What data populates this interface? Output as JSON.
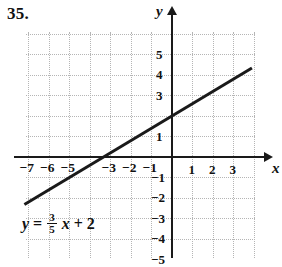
{
  "problem": {
    "number": "35."
  },
  "chart_data": {
    "type": "line",
    "title": "",
    "equation_text": "y = 3/5 x + 2",
    "equation_parts": {
      "lhs": "y",
      "equals": "=",
      "numerator": "3",
      "denominator": "5",
      "variable": "x",
      "plus": "+",
      "constant": "2"
    },
    "slope": 0.6,
    "intercept": 2,
    "xlabel": "x",
    "ylabel": "y",
    "xlim": [
      -7.2,
      4.0
    ],
    "ylim": [
      -5.0,
      6.1
    ],
    "grid": true,
    "grid_style": "dotted",
    "x_ticks": [
      -7,
      -6,
      -5,
      -3,
      -2,
      -1,
      1,
      2,
      3
    ],
    "x_tick_labels": [
      "-7",
      "-6",
      "-5",
      "-3",
      "-2",
      "-1",
      "1",
      "2",
      "3"
    ],
    "y_ticks": [
      5,
      4,
      3,
      1,
      -1,
      -2,
      -3,
      -4,
      -5
    ],
    "y_tick_labels": [
      "5",
      "4",
      "3",
      "1",
      "-1",
      "-2",
      "-3",
      "-4",
      "-5"
    ],
    "line_endpoints": [
      {
        "x": -7.2,
        "y": -2.32
      },
      {
        "x": 3.9,
        "y": 4.34
      }
    ],
    "key_points": [
      {
        "x": 0,
        "y": 2,
        "label": "y-intercept"
      },
      {
        "x": -3.333,
        "y": 0,
        "label": "x-intercept"
      }
    ],
    "colors": {
      "line": "#1a1a1a",
      "axis": "#1a1a1a",
      "grid": "#b5b5b5",
      "text": "#111111",
      "background": "#ffffff"
    }
  }
}
